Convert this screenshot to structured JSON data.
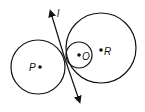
{
  "diagram": {
    "type": "geometry",
    "line": {
      "label": "l",
      "x1": 51,
      "y1": 12,
      "x2": 80,
      "y2": 101
    },
    "circles": [
      {
        "id": "P",
        "label": "P",
        "cx": 38,
        "cy": 67,
        "r": 27
      },
      {
        "id": "R",
        "label": "R",
        "cx": 101,
        "cy": 48,
        "r": 35
      },
      {
        "id": "O",
        "label": "O",
        "cx": 79,
        "cy": 55,
        "r": 13
      }
    ],
    "points": [
      {
        "label": "P",
        "x": 40,
        "y": 67
      },
      {
        "label": "O",
        "x": 79,
        "y": 55
      },
      {
        "label": "R",
        "x": 101,
        "y": 50
      }
    ],
    "stroke_color": "#111111"
  }
}
